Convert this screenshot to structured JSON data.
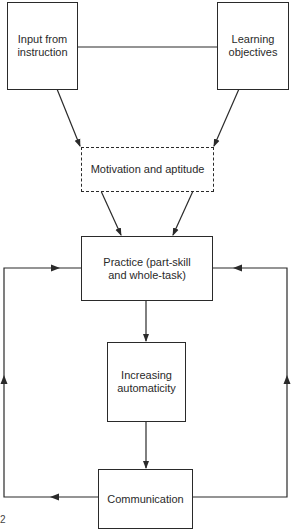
{
  "diagram": {
    "nodes": [
      {
        "id": "input",
        "label": "Input from\ninstruction"
      },
      {
        "id": "objectives",
        "label": "Learning\nobjectives"
      },
      {
        "id": "motivation",
        "label": "Motivation and aptitude",
        "style": "dashed"
      },
      {
        "id": "practice",
        "label": "Practice (part-skill\nand whole-task)"
      },
      {
        "id": "automaticity",
        "label": "Increasing\nautomaticity"
      },
      {
        "id": "communication",
        "label": "Communication"
      }
    ],
    "edges": [
      {
        "from": "input",
        "to": "objectives",
        "type": "line"
      },
      {
        "from": "input",
        "to": "motivation",
        "type": "arrow"
      },
      {
        "from": "objectives",
        "to": "motivation",
        "type": "arrow"
      },
      {
        "from": "motivation",
        "to": "practice",
        "type": "arrow",
        "count": 2
      },
      {
        "from": "practice",
        "to": "automaticity",
        "type": "arrow"
      },
      {
        "from": "automaticity",
        "to": "communication",
        "type": "arrow"
      },
      {
        "from": "communication",
        "to": "practice",
        "type": "feedback-loop",
        "side": "left"
      },
      {
        "from": "communication",
        "to": "practice",
        "type": "feedback-loop",
        "side": "right"
      }
    ],
    "corner_mark": "2"
  }
}
